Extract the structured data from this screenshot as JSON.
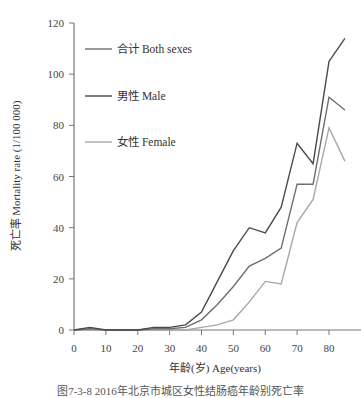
{
  "chart_data": {
    "type": "line",
    "title": "",
    "xlabel": "年龄(岁) Age(years)",
    "ylabel": "死亡率 Mortality rate (1/100 000)",
    "xlim": [
      0,
      85
    ],
    "ylim": [
      0,
      120
    ],
    "xticks": [
      0,
      10,
      20,
      30,
      40,
      50,
      60,
      70,
      80
    ],
    "yticks": [
      0,
      20,
      40,
      60,
      80,
      100,
      120
    ],
    "grid": false,
    "legend_position": "upper-left-inside",
    "x": [
      0,
      5,
      10,
      15,
      20,
      25,
      30,
      35,
      40,
      45,
      50,
      55,
      60,
      65,
      70,
      75,
      80,
      85
    ],
    "series": [
      {
        "name": "合计 Both sexes",
        "color": "#6e6e6e",
        "values": [
          0,
          0.5,
          0,
          0,
          0,
          0.5,
          0.5,
          1,
          4,
          10,
          17,
          25,
          28,
          32,
          57,
          57,
          91,
          86
        ]
      },
      {
        "name": "男性 Male",
        "color": "#4a4a4a",
        "values": [
          0,
          1,
          0,
          0,
          0,
          1,
          1,
          2,
          7,
          19,
          31,
          40,
          38,
          48,
          73,
          65,
          105,
          114
        ]
      },
      {
        "name": "女性 Female",
        "color": "#a8a8a8",
        "values": [
          0,
          0,
          0,
          0,
          0,
          0,
          0,
          0,
          1,
          2,
          4,
          11,
          19,
          18,
          42,
          51,
          79,
          66
        ]
      }
    ]
  },
  "caption": "图7-3-8 2016年北京市城区女性结肠癌年龄别死亡率"
}
